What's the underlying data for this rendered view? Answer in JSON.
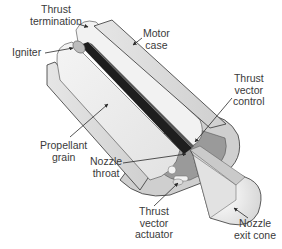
{
  "diagram": {
    "colors": {
      "background": "#ffffff",
      "case_fill": "#d9d9d9",
      "grain_fill": "#ededed",
      "dark_core": "#1e1e1e",
      "mid_gray": "#9a9a9a",
      "outline": "#333333",
      "text": "#3a3a3a"
    },
    "labels": {
      "thrust_termination": {
        "line1": "Thrust",
        "line2": "termination"
      },
      "motor_case": {
        "line1": "Motor",
        "line2": "case"
      },
      "igniter": {
        "line1": "Igniter"
      },
      "thrust_vector_control": {
        "line1": "Thrust",
        "line2": "vector",
        "line3": "control"
      },
      "propellant_grain": {
        "line1": "Propellant",
        "line2": "grain"
      },
      "nozzle_throat": {
        "line1": "Nozzle",
        "line2": "throat"
      },
      "thrust_vector_actuator": {
        "line1": "Thrust",
        "line2": "vector",
        "line3": "actuator"
      },
      "nozzle_exit_cone": {
        "line1": "Nozzle",
        "line2": "exit cone"
      }
    }
  }
}
